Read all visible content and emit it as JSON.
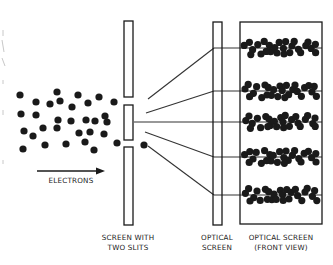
{
  "diagram": {
    "colors": {
      "ink": "#1a1a1a",
      "line": "#333333",
      "background": "#ffffff",
      "artifact": "#c8c8c8"
    },
    "labels": {
      "electrons": "ELECTRONS",
      "slit_screen_line1": "SCREEN WITH",
      "slit_screen_line2": "TWO SLITS",
      "optical_screen_line1": "OPTICAL",
      "optical_screen_line2": "SCREEN",
      "front_view_line1": "OPTICAL SCREEN",
      "front_view_line2": "(FRONT VIEW)"
    },
    "electron_cloud": [
      [
        20,
        95
      ],
      [
        57,
        92
      ],
      [
        78,
        95
      ],
      [
        99,
        97
      ],
      [
        36,
        102
      ],
      [
        50,
        104
      ],
      [
        60,
        101
      ],
      [
        72,
        107
      ],
      [
        88,
        103
      ],
      [
        114,
        102
      ],
      [
        21,
        114
      ],
      [
        36,
        115
      ],
      [
        58,
        120
      ],
      [
        71,
        121
      ],
      [
        86,
        120
      ],
      [
        95,
        121
      ],
      [
        105,
        116
      ],
      [
        107,
        122
      ],
      [
        24,
        131
      ],
      [
        33,
        136
      ],
      [
        43,
        128
      ],
      [
        57,
        128
      ],
      [
        79,
        133
      ],
      [
        90,
        132
      ],
      [
        104,
        134
      ],
      [
        23,
        149
      ],
      [
        45,
        145
      ],
      [
        66,
        144
      ],
      [
        85,
        142
      ],
      [
        94,
        150
      ],
      [
        117,
        143
      ],
      [
        144,
        145
      ]
    ],
    "slit_screen": {
      "x": 124,
      "width": 9,
      "segments": [
        [
          21,
          97
        ],
        [
          105,
          140
        ],
        [
          147,
          225
        ]
      ]
    },
    "optical_screen": {
      "x": 213,
      "width": 9,
      "top": 22,
      "bottom": 225
    },
    "front_view_box": {
      "x": 240,
      "y": 22,
      "width": 82,
      "height": 202
    },
    "rays": [
      {
        "from": [
          148,
          99
        ],
        "to": [
          214,
          48
        ]
      },
      {
        "from": [
          146,
          113
        ],
        "to": [
          214,
          91
        ]
      },
      {
        "from": [
          134,
          122
        ],
        "to": [
          214,
          122
        ]
      },
      {
        "from": [
          145,
          132
        ],
        "to": [
          214,
          157
        ]
      },
      {
        "from": [
          148,
          146
        ],
        "to": [
          214,
          195
        ]
      }
    ],
    "fringe_y": [
      48,
      91,
      122,
      157,
      195
    ],
    "arrow": {
      "x1": 37,
      "x2": 105,
      "y": 171
    }
  }
}
